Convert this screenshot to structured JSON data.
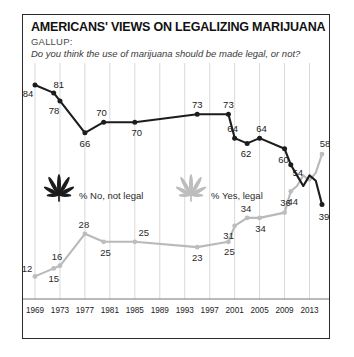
{
  "header": {
    "title": "AMERICANS' VIEWS ON LEGALIZING MARIJUANA",
    "source": "GALLUP:",
    "question": "Do you think the use of marijuana should be made legal, or not?"
  },
  "legend": {
    "items": [
      {
        "label": "% No, not legal",
        "icon": "marijuana-leaf-icon",
        "color": "#1c1c1c"
      },
      {
        "label": "% Yes, legal",
        "icon": "marijuana-leaf-icon",
        "color": "#bdbdbd"
      }
    ]
  },
  "chart_data": {
    "type": "line",
    "title": "AMERICANS' VIEWS ON LEGALIZING MARIJUANA",
    "subtitle": "Do you think the use of marijuana should be made legal, or not?",
    "xlabel": "",
    "ylabel": "",
    "xlim": [
      1969,
      2015
    ],
    "ylim": [
      0,
      100
    ],
    "grid": "vertical",
    "legend_position": "middle-left",
    "xticks": [
      "1969",
      "1973",
      "1977",
      "1981",
      "1985",
      "1989",
      "1993",
      "1997",
      "2001",
      "2005",
      "2009",
      "2013"
    ],
    "series": [
      {
        "name": "% No, not legal",
        "color": "#1c1c1c",
        "x": [
          1969,
          1972,
          1973,
          1977,
          1980,
          1985,
          1995,
          2000,
          2001,
          2003,
          2005,
          2009,
          2010,
          2011,
          2012,
          2013,
          2014,
          2015
        ],
        "values": [
          84,
          81,
          78,
          66,
          70,
          70,
          73,
          73,
          64,
          62,
          64,
          60,
          54,
          50,
          46,
          50,
          48,
          39
        ],
        "labeled_points": [
          {
            "x": 1969,
            "value": 84
          },
          {
            "x": 1972,
            "value": 81
          },
          {
            "x": 1973,
            "value": 78
          },
          {
            "x": 1977,
            "value": 66
          },
          {
            "x": 1980,
            "value": 70
          },
          {
            "x": 1985,
            "value": 70
          },
          {
            "x": 1995,
            "value": 73
          },
          {
            "x": 2000,
            "value": 73
          },
          {
            "x": 2001,
            "value": 64
          },
          {
            "x": 2003,
            "value": 62
          },
          {
            "x": 2005,
            "value": 64
          },
          {
            "x": 2009,
            "value": 60
          },
          {
            "x": 2010,
            "value": 54
          },
          {
            "x": 2015,
            "value": 39
          }
        ]
      },
      {
        "name": "% Yes, legal",
        "color": "#bdbdbd",
        "x": [
          1969,
          1972,
          1973,
          1977,
          1980,
          1985,
          1995,
          2000,
          2001,
          2003,
          2005,
          2009,
          2010,
          2011,
          2012,
          2013,
          2014,
          2015
        ],
        "values": [
          12,
          15,
          16,
          28,
          25,
          25,
          23,
          25,
          31,
          34,
          34,
          36,
          44,
          46,
          50,
          48,
          51,
          58
        ],
        "labeled_points": [
          {
            "x": 1969,
            "value": 12
          },
          {
            "x": 1972,
            "value": 15
          },
          {
            "x": 1973,
            "value": 16
          },
          {
            "x": 1977,
            "value": 28
          },
          {
            "x": 1980,
            "value": 25
          },
          {
            "x": 1985,
            "value": 25
          },
          {
            "x": 1995,
            "value": 23
          },
          {
            "x": 2000,
            "value": 25
          },
          {
            "x": 2001,
            "value": 31
          },
          {
            "x": 2003,
            "value": 34
          },
          {
            "x": 2005,
            "value": 34
          },
          {
            "x": 2009,
            "value": 36
          },
          {
            "x": 2010,
            "value": 44
          },
          {
            "x": 2015,
            "value": 58
          }
        ]
      }
    ]
  }
}
